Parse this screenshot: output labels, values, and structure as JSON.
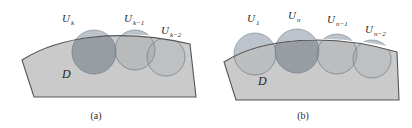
{
  "figure": {
    "background_color": "#ffffff",
    "domain_fill": "#c9c9c9",
    "domain_stroke": "#5a5a5a",
    "circle_fill": "#b3bcc4",
    "circle_stroke": "#6f8296",
    "overlap_dark": "#8d9298",
    "label_color": "#2b2b2b"
  },
  "panel_a": {
    "caption": "(a)",
    "domain_label": "D",
    "circles": [
      {
        "label_base": "U",
        "label_sub": "k",
        "label": "U_k",
        "cx": 94,
        "cy": 52,
        "r": 22
      },
      {
        "label_base": "U",
        "label_sub": "k−1",
        "label": "U_k−1",
        "cx": 135,
        "cy": 50,
        "r": 20
      },
      {
        "label_base": "U",
        "label_sub": "k−2",
        "label": "U_k−2",
        "cx": 166,
        "cy": 57,
        "r": 19
      }
    ],
    "labels": [
      {
        "base": "U",
        "sub": "k",
        "x": 62,
        "y": 22
      },
      {
        "base": "U",
        "sub": "k−1",
        "x": 124,
        "y": 22
      },
      {
        "base": "U",
        "sub": "k−2",
        "x": 161,
        "y": 34
      }
    ]
  },
  "panel_b": {
    "caption": "(b)",
    "domain_label": "D",
    "circles": [
      {
        "label_base": "U",
        "label_sub": "1",
        "label": "U_1",
        "cx": 255,
        "cy": 54,
        "r": 21
      },
      {
        "label_base": "U",
        "label_sub": "n",
        "label": "U_n",
        "cx": 297,
        "cy": 51,
        "r": 22
      },
      {
        "label_base": "U",
        "label_sub": "n−1",
        "label": "U_n−1",
        "cx": 337,
        "cy": 54,
        "r": 20
      },
      {
        "label_base": "U",
        "label_sub": "n−2",
        "label": "U_n−2",
        "cx": 372,
        "cy": 59,
        "r": 19
      }
    ],
    "labels": [
      {
        "base": "U",
        "sub": "1",
        "x": 247,
        "y": 22
      },
      {
        "base": "U",
        "sub": "n",
        "x": 288,
        "y": 19
      },
      {
        "base": "U",
        "sub": "n−1",
        "x": 327,
        "y": 23
      },
      {
        "base": "U",
        "sub": "n−2",
        "x": 365,
        "y": 33
      }
    ]
  }
}
